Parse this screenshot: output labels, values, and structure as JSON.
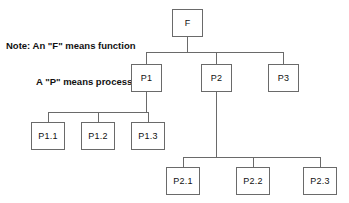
{
  "diagram": {
    "title_note": {
      "line1": "Note: An \"F\" means function",
      "line2": "A \"P\" means process"
    },
    "stroke_color": "#6a6a6a",
    "text_color": "#111111",
    "background": "#ffffff",
    "nodes": [
      {
        "id": "F",
        "label": "F",
        "x": 172,
        "y": 9,
        "w": 31,
        "h": 28,
        "level": 0
      },
      {
        "id": "P1",
        "label": "P1",
        "x": 131,
        "y": 64,
        "w": 31,
        "h": 28,
        "level": 1
      },
      {
        "id": "P2",
        "label": "P2",
        "x": 201,
        "y": 64,
        "w": 31,
        "h": 28,
        "level": 1
      },
      {
        "id": "P3",
        "label": "P3",
        "x": 268,
        "y": 64,
        "w": 31,
        "h": 28,
        "level": 1
      },
      {
        "id": "P1.1",
        "label": "P1.1",
        "x": 31,
        "y": 122,
        "w": 34,
        "h": 28,
        "level": 2
      },
      {
        "id": "P1.2",
        "label": "P1.2",
        "x": 81,
        "y": 122,
        "w": 34,
        "h": 28,
        "level": 2
      },
      {
        "id": "P1.3",
        "label": "P1.3",
        "x": 131,
        "y": 122,
        "w": 34,
        "h": 28,
        "level": 2
      },
      {
        "id": "P2.1",
        "label": "P2.1",
        "x": 166,
        "y": 167,
        "w": 34,
        "h": 28,
        "level": 2
      },
      {
        "id": "P2.2",
        "label": "P2.2",
        "x": 236,
        "y": 167,
        "w": 34,
        "h": 28,
        "level": 2
      },
      {
        "id": "P2.3",
        "label": "P2.3",
        "x": 303,
        "y": 167,
        "w": 34,
        "h": 28,
        "level": 2
      }
    ],
    "edges": [
      {
        "from": "F",
        "to": "P1"
      },
      {
        "from": "F",
        "to": "P2"
      },
      {
        "from": "F",
        "to": "P3"
      },
      {
        "from": "P1",
        "to": "P1.1"
      },
      {
        "from": "P1",
        "to": "P1.2"
      },
      {
        "from": "P1",
        "to": "P1.3"
      },
      {
        "from": "P2",
        "to": "P2.1"
      },
      {
        "from": "P2",
        "to": "P2.2"
      },
      {
        "from": "P2",
        "to": "P2.3"
      }
    ],
    "bus_lines": [
      {
        "name": "root-bus",
        "x1": 146.5,
        "y1": 52,
        "x2": 283.5,
        "y2": 52
      },
      {
        "name": "p1-bus",
        "x1": 48,
        "y1": 112,
        "x2": 148,
        "y2": 112
      },
      {
        "name": "p2-bus",
        "x1": 183,
        "y1": 157,
        "x2": 320,
        "y2": 157
      }
    ],
    "stems": [
      {
        "name": "f-down",
        "x1": 187.5,
        "y1": 37,
        "x2": 187.5,
        "y2": 52
      },
      {
        "name": "p1-up",
        "x1": 146.5,
        "y1": 52,
        "x2": 146.5,
        "y2": 64
      },
      {
        "name": "p2-up",
        "x1": 216.5,
        "y1": 52,
        "x2": 216.5,
        "y2": 64
      },
      {
        "name": "p3-up",
        "x1": 283.5,
        "y1": 52,
        "x2": 283.5,
        "y2": 64
      },
      {
        "name": "p1-down",
        "x1": 146.5,
        "y1": 92,
        "x2": 146.5,
        "y2": 112
      },
      {
        "name": "p11-up",
        "x1": 48,
        "y1": 112,
        "x2": 48,
        "y2": 122
      },
      {
        "name": "p12-up",
        "x1": 98,
        "y1": 112,
        "x2": 98,
        "y2": 122
      },
      {
        "name": "p13-up",
        "x1": 148,
        "y1": 112,
        "x2": 148,
        "y2": 122
      },
      {
        "name": "p2-down",
        "x1": 216.5,
        "y1": 92,
        "x2": 216.5,
        "y2": 157
      },
      {
        "name": "p21-up",
        "x1": 183,
        "y1": 157,
        "x2": 183,
        "y2": 167
      },
      {
        "name": "p22-up",
        "x1": 253,
        "y1": 157,
        "x2": 253,
        "y2": 167
      },
      {
        "name": "p23-up",
        "x1": 320,
        "y1": 157,
        "x2": 320,
        "y2": 167
      }
    ]
  }
}
